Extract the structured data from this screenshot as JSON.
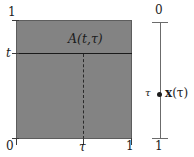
{
  "figure": {
    "colors": {
      "square_fill": "#838383",
      "square_border": "#5d5d5d",
      "solid_line": "#1a1a1a",
      "dashed_line": "#2a2a2a",
      "axis_line": "#6b6b6b",
      "text": "#1c1c1c",
      "background": "#ffffff"
    }
  },
  "square_panel": {
    "name": "unit-square",
    "region_label": "A(t,τ)",
    "y_axis": {
      "top_label": "1",
      "mid_label": "t",
      "bottom_label": "0"
    },
    "x_axis": {
      "left_label": "0",
      "mid_label": "τ",
      "right_label": "1"
    },
    "horizontal_line_at": "t",
    "vertical_dashed_line_at": "τ"
  },
  "axis_panel": {
    "name": "tau-interval-axis",
    "top_label": "0",
    "bottom_label": "1",
    "point_label": "τ",
    "point_value_label_prefix": "x",
    "point_value_label_arg": "(τ)",
    "point_value_label": "x(τ)"
  }
}
